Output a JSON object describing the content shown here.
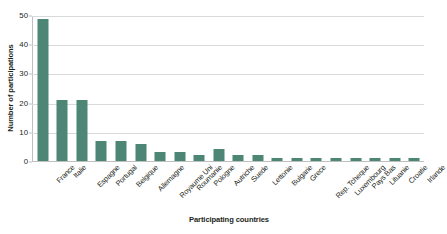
{
  "chart_data": {
    "type": "bar",
    "title": "",
    "xlabel": "Participating countries",
    "ylabel": "Number of participations",
    "categories": [
      "France",
      "Italie",
      "Espagne",
      "Portugal",
      "Belgique",
      "Allemagne",
      "Royaume Uni",
      "Roumanie",
      "Pologne",
      "Autriche",
      "Suede",
      "Lettonie",
      "Bulgarie",
      "Grece",
      "Rep. Tcheque",
      "Luxembourg",
      "Pays Bas",
      "Lituanie",
      "Croatie",
      "Irlande"
    ],
    "values": [
      49,
      21,
      21,
      7,
      7,
      6,
      3,
      3,
      2,
      4,
      2,
      2,
      1,
      1,
      1,
      1,
      1,
      1,
      1,
      1
    ],
    "ylim": [
      0,
      50
    ],
    "ytick_labels": [
      "0",
      "10",
      "20",
      "30",
      "40",
      "50"
    ],
    "ytick_values": [
      0,
      10,
      20,
      30,
      40,
      50
    ],
    "grid": "horizontal",
    "legend": "none",
    "bar_color": "#4d8674",
    "gridline_color": "#d9d9d9",
    "axis_color": "#bfbfbf",
    "background_color": "#ffffff",
    "text_color": "#231f20"
  }
}
